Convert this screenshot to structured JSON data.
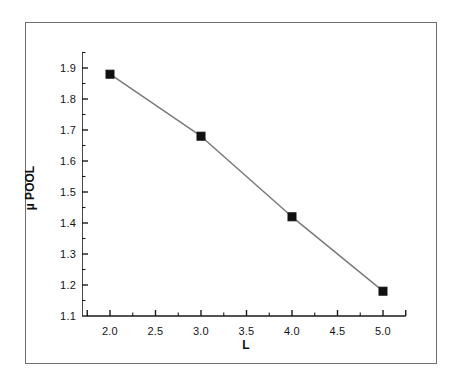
{
  "chart_data": {
    "type": "line",
    "title": "",
    "subtitle": "",
    "xlabel": "L",
    "ylabel": "µ POOL",
    "x": [
      2.0,
      3.0,
      4.0,
      5.0
    ],
    "values": [
      1.88,
      1.68,
      1.42,
      1.18
    ],
    "series": [
      {
        "name": "µ POOL",
        "x": [
          2.0,
          3.0,
          4.0,
          5.0
        ],
        "values": [
          1.88,
          1.68,
          1.42,
          1.18
        ],
        "marker": "filled-square",
        "marker_color": "#101010",
        "line_color": "#7a7a7a"
      }
    ],
    "xlim": [
      1.75,
      5.25
    ],
    "ylim": [
      1.1,
      1.95
    ],
    "xticks": [
      2.0,
      2.5,
      3.0,
      3.5,
      4.0,
      4.5,
      5.0
    ],
    "xtick_labels": [
      "2.0",
      "2.5",
      "3.0",
      "3.5",
      "4.0",
      "4.5",
      "5.0"
    ],
    "x_minor_ticks": [
      2.25,
      2.75,
      3.25,
      3.75,
      4.25,
      4.75
    ],
    "yticks": [
      1.1,
      1.2,
      1.3,
      1.4,
      1.5,
      1.6,
      1.7,
      1.8,
      1.9
    ],
    "ytick_labels": [
      "1.1",
      "1.2",
      "1.3",
      "1.4",
      "1.5",
      "1.6",
      "1.7",
      "1.8",
      "1.9"
    ],
    "y_minor_ticks": [
      1.15,
      1.25,
      1.35,
      1.45,
      1.55,
      1.65,
      1.75,
      1.85,
      1.95
    ],
    "grid": false,
    "legend": null,
    "legend_position": "none",
    "annotations": []
  },
  "figure": {
    "background_color": "#ffffff",
    "frame_color": "#6f6f6f",
    "axis_color": "#1a1a1a"
  }
}
